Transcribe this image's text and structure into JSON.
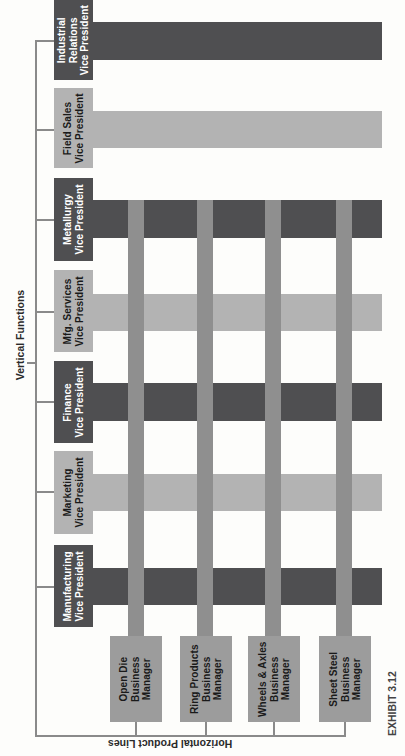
{
  "diagram": {
    "vertical_axis_label": "Vertical Functions",
    "horizontal_axis_label": "Horizontal Product Lines",
    "exhibit_label": "EXHIBIT 3.12",
    "colors": {
      "dark_function": "#4f4f51",
      "light_function": "#b3b3b3",
      "product_bar": "#8f8f8f",
      "business_manager_box": "#9c9c9c",
      "connector_line": "#8a8a8a"
    },
    "vertical_functions": [
      {
        "line1": "Industrial",
        "line2": "Relations",
        "line3": "Vice President",
        "shade": "dark"
      },
      {
        "line1": "Field Sales",
        "line2": "Vice President",
        "shade": "light"
      },
      {
        "line1": "Metallurgy",
        "line2": "Vice President",
        "shade": "dark"
      },
      {
        "line1": "Mfg. Services",
        "line2": "Vice President",
        "shade": "light"
      },
      {
        "line1": "Finance",
        "line2": "Vice President",
        "shade": "dark"
      },
      {
        "line1": "Marketing",
        "line2": "Vice President",
        "shade": "light"
      },
      {
        "line1": "Manufacturing",
        "line2": "Vice President",
        "shade": "dark"
      }
    ],
    "horizontal_product_lines": [
      {
        "line1": "Open Die",
        "line2": "Business",
        "line3": "Manager"
      },
      {
        "line1": "Ring Products",
        "line2": "Business",
        "line3": "Manager"
      },
      {
        "line1": "Wheels & Axles",
        "line2": "Business",
        "line3": "Manager"
      },
      {
        "line1": "Sheet Steel",
        "line2": "Business",
        "line3": "Manager"
      }
    ]
  }
}
